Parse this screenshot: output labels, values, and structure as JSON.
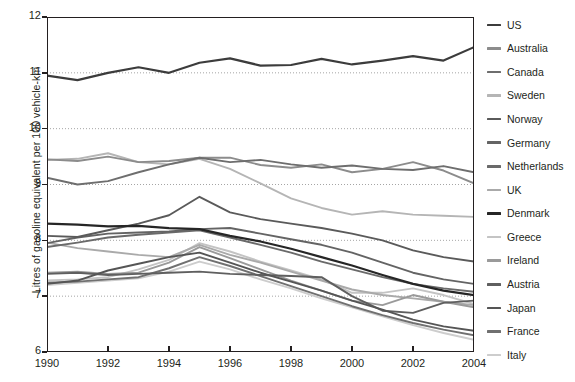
{
  "chart_data": {
    "type": "line",
    "title": "",
    "xlabel": "",
    "ylabel": "Litres of gasoline equivalent per 100 vehicle-km",
    "xlim": [
      1990,
      2004
    ],
    "ylim": [
      6,
      12
    ],
    "grid": "horizontal-dotted",
    "legend_position": "right",
    "x": [
      1990,
      1991,
      1992,
      1993,
      1994,
      1995,
      1996,
      1997,
      1998,
      1999,
      2000,
      2001,
      2002,
      2003,
      2004
    ],
    "xticks": [
      "1990",
      "1992",
      "1994",
      "1996",
      "1998",
      "2000",
      "2002",
      "2004"
    ],
    "yticks": [
      "6",
      "7",
      "8",
      "9",
      "10",
      "11",
      "12"
    ],
    "series": [
      {
        "name": "US",
        "color": "#3c3c3c",
        "values": [
          10.95,
          10.87,
          11.0,
          11.1,
          11.0,
          11.18,
          11.26,
          11.13,
          11.14,
          11.25,
          11.15,
          11.22,
          11.3,
          11.22,
          11.46
        ]
      },
      {
        "name": "Australia",
        "color": "#8c8c8c",
        "values": [
          9.45,
          9.42,
          9.5,
          9.4,
          9.42,
          9.48,
          9.48,
          9.35,
          9.3,
          9.36,
          9.22,
          9.28,
          9.4,
          9.25,
          9.02
        ]
      },
      {
        "name": "Canada",
        "color": "#6e6e6e",
        "values": [
          9.12,
          9.0,
          9.06,
          9.22,
          9.36,
          9.48,
          9.4,
          9.44,
          9.36,
          9.3,
          9.34,
          9.28,
          9.26,
          9.33,
          9.22
        ]
      },
      {
        "name": "Sweden",
        "color": "#b5b5b5",
        "values": [
          9.44,
          9.46,
          9.56,
          9.4,
          9.36,
          9.46,
          9.28,
          9.02,
          8.75,
          8.58,
          8.46,
          8.52,
          8.46,
          8.44,
          8.42
        ]
      },
      {
        "name": "Norway",
        "color": "#5a5a5a",
        "values": [
          8.08,
          8.06,
          8.18,
          8.3,
          8.45,
          8.78,
          8.5,
          8.38,
          8.3,
          8.22,
          8.12,
          8.0,
          7.82,
          7.7,
          7.62
        ]
      },
      {
        "name": "Germany",
        "color": "#646464",
        "values": [
          7.95,
          8.05,
          8.12,
          8.14,
          8.16,
          8.2,
          8.22,
          8.12,
          8.02,
          7.92,
          7.78,
          7.6,
          7.42,
          7.3,
          7.22
        ]
      },
      {
        "name": "Netherlands",
        "color": "#6a6a6a",
        "values": [
          7.88,
          7.96,
          8.05,
          8.1,
          8.14,
          8.18,
          8.05,
          7.92,
          7.78,
          7.62,
          7.48,
          7.34,
          7.22,
          7.14,
          7.08
        ]
      },
      {
        "name": "UK",
        "color": "#aaaaaa",
        "values": [
          7.96,
          7.86,
          7.8,
          7.74,
          7.7,
          7.92,
          7.74,
          7.6,
          7.44,
          7.28,
          7.12,
          7.02,
          6.96,
          6.9,
          6.84
        ]
      },
      {
        "name": "Denmark",
        "color": "#262626",
        "values": [
          8.3,
          8.28,
          8.25,
          8.26,
          8.22,
          8.2,
          8.08,
          7.98,
          7.85,
          7.7,
          7.55,
          7.38,
          7.22,
          7.1,
          7.02
        ]
      },
      {
        "name": "Greece",
        "color": "#c4c4c4",
        "values": [
          7.28,
          7.3,
          7.34,
          7.48,
          7.65,
          7.95,
          7.8,
          7.62,
          7.46,
          7.3,
          7.06,
          7.06,
          7.14,
          7.02,
          6.86
        ]
      },
      {
        "name": "Ireland",
        "color": "#9a9a9a",
        "values": [
          7.42,
          7.44,
          7.4,
          7.42,
          7.6,
          7.88,
          7.68,
          7.48,
          7.28,
          7.1,
          6.92,
          6.84,
          7.02,
          6.9,
          6.8
        ]
      },
      {
        "name": "Austria",
        "color": "#5f5f5f",
        "values": [
          7.4,
          7.42,
          7.38,
          7.4,
          7.42,
          7.44,
          7.4,
          7.38,
          7.36,
          7.34,
          7.0,
          6.74,
          6.7,
          6.88,
          6.92
        ]
      },
      {
        "name": "Japan",
        "color": "#555555",
        "values": [
          7.22,
          7.28,
          7.46,
          7.58,
          7.7,
          7.78,
          7.6,
          7.42,
          7.26,
          7.1,
          6.92,
          6.76,
          6.58,
          6.46,
          6.38
        ]
      },
      {
        "name": "France",
        "color": "#707070",
        "values": [
          7.24,
          7.26,
          7.3,
          7.34,
          7.5,
          7.7,
          7.54,
          7.36,
          7.18,
          7.0,
          6.82,
          6.66,
          6.52,
          6.4,
          6.3
        ]
      },
      {
        "name": "Italy",
        "color": "#cdcdcd",
        "values": [
          7.2,
          7.24,
          7.28,
          7.32,
          7.44,
          7.62,
          7.48,
          7.3,
          7.14,
          6.96,
          6.8,
          6.64,
          6.48,
          6.34,
          6.22
        ]
      }
    ]
  },
  "axis": {
    "ylabel": "Litres of gasoline equivalent per 100 vehicle-km"
  },
  "legend": {
    "items": [
      {
        "label": "US"
      },
      {
        "label": "Australia"
      },
      {
        "label": "Canada"
      },
      {
        "label": "Sweden"
      },
      {
        "label": "Norway"
      },
      {
        "label": "Germany"
      },
      {
        "label": "Netherlands"
      },
      {
        "label": "UK"
      },
      {
        "label": "Denmark"
      },
      {
        "label": "Greece"
      },
      {
        "label": "Ireland"
      },
      {
        "label": "Austria"
      },
      {
        "label": "Japan"
      },
      {
        "label": "France"
      },
      {
        "label": "Italy"
      }
    ]
  }
}
